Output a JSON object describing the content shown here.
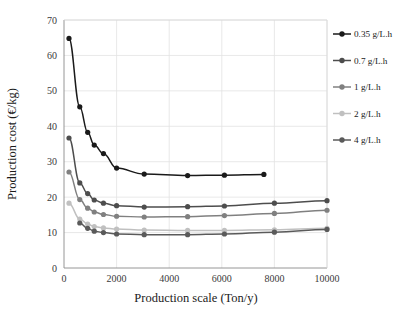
{
  "chart_data": {
    "type": "line",
    "title": "",
    "xlabel": "Production  scale (Ton/y)",
    "ylabel": "Production  cost (€/kg)",
    "xlim": [
      0,
      10000
    ],
    "ylim": [
      0,
      70
    ],
    "xticks": [
      0,
      2000,
      4000,
      6000,
      8000,
      10000
    ],
    "yticks": [
      0,
      10,
      20,
      30,
      40,
      50,
      60,
      70
    ],
    "xtick_labels": [
      "0",
      "2000",
      "4000",
      "6000",
      "8000",
      "10000"
    ],
    "ytick_labels": [
      "0",
      "10",
      "20",
      "30",
      "40",
      "50",
      "60",
      "70"
    ],
    "grid": true,
    "legend_position": "right-outside",
    "series": [
      {
        "name": "0.35 g/L.h",
        "color": "#1a1a1a",
        "points": [
          [
            190,
            64.8
          ],
          [
            600,
            45.5
          ],
          [
            900,
            38.3
          ],
          [
            1150,
            34.7
          ],
          [
            1500,
            32.3
          ],
          [
            2000,
            28.2
          ],
          [
            3050,
            26.5
          ],
          [
            4700,
            26.1
          ],
          [
            6100,
            26.2
          ],
          [
            7600,
            26.4
          ]
        ]
      },
      {
        "name": "0.7 g/L.h",
        "color": "#4d4d4d",
        "points": [
          [
            190,
            36.7
          ],
          [
            600,
            24.0
          ],
          [
            900,
            21.0
          ],
          [
            1150,
            19.2
          ],
          [
            1500,
            18.3
          ],
          [
            2000,
            17.6
          ],
          [
            3050,
            17.2
          ],
          [
            4700,
            17.3
          ],
          [
            6100,
            17.5
          ],
          [
            8000,
            18.3
          ],
          [
            10000,
            19.0
          ]
        ]
      },
      {
        "name": "1 g/L.h",
        "color": "#808080",
        "points": [
          [
            190,
            27.1
          ],
          [
            600,
            19.3
          ],
          [
            900,
            16.9
          ],
          [
            1150,
            15.8
          ],
          [
            1500,
            15.1
          ],
          [
            2000,
            14.6
          ],
          [
            3050,
            14.4
          ],
          [
            4700,
            14.5
          ],
          [
            6100,
            14.8
          ],
          [
            8000,
            15.4
          ],
          [
            10000,
            16.3
          ]
        ]
      },
      {
        "name": "2 g/L.h",
        "color": "#c0c0c0",
        "points": [
          [
            190,
            18.3
          ],
          [
            600,
            13.8
          ],
          [
            900,
            12.4
          ],
          [
            1150,
            11.7
          ],
          [
            1500,
            11.3
          ],
          [
            2000,
            11.0
          ],
          [
            3050,
            10.7
          ],
          [
            4700,
            10.6
          ],
          [
            6100,
            10.6
          ],
          [
            8000,
            10.8
          ],
          [
            10000,
            11.2
          ]
        ]
      },
      {
        "name": "4 g/L.h",
        "color": "#5a5a5a",
        "points": [
          [
            600,
            12.7
          ],
          [
            900,
            11.2
          ],
          [
            1150,
            10.4
          ],
          [
            1500,
            10.0
          ],
          [
            2000,
            9.6
          ],
          [
            3050,
            9.4
          ],
          [
            4700,
            9.4
          ],
          [
            6100,
            9.6
          ],
          [
            8000,
            10.1
          ],
          [
            10000,
            10.9
          ]
        ]
      }
    ]
  }
}
